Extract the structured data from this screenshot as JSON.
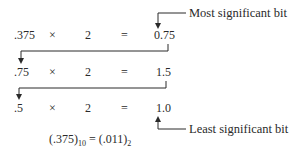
{
  "rows": [
    {
      "operand": ".375",
      "times": "×",
      "multiplier": "2",
      "equals": "=",
      "result": "0.75"
    },
    {
      "operand": ".75",
      "times": "×",
      "multiplier": "2",
      "equals": "=",
      "result": "1.5"
    },
    {
      "operand": ".5",
      "times": "×",
      "multiplier": "2",
      "equals": "=",
      "result": "1.0"
    }
  ],
  "annotations": {
    "msb": "Most significant bit",
    "lsb": "Least significant bit"
  },
  "conclusion": {
    "left_value": "(.375)",
    "left_base": "10",
    "equals": " = ",
    "right_value": "(.011)",
    "right_base": "2"
  }
}
